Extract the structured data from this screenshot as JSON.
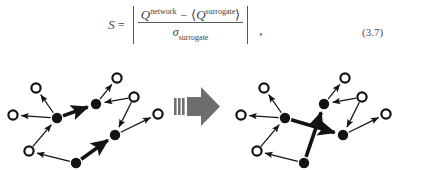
{
  "page": {
    "background": "#ffffff",
    "ink_color": "#2b2b2b"
  },
  "equation": {
    "label": "(3.7)",
    "lhs": "S",
    "relation": "=",
    "abs_bar": "|",
    "numerator": {
      "first_symbol": "Q",
      "first_superscript": "network",
      "operator": "−",
      "angle_open": "⟨",
      "second_symbol": "Q",
      "second_superscript": "surrogate",
      "angle_close": "⟩"
    },
    "denominator": {
      "symbol": "σ",
      "subscript": "surrogate"
    },
    "trailing_punctuation": ",",
    "plain_text": "S = |(Q^network − ⟨Q^surrogate⟩) / σ_surrogate|"
  },
  "figure": {
    "caption": "",
    "transition": {
      "icon": "block-arrow-right-icon",
      "color": "#6e6e6e",
      "stripes": 3
    },
    "networks": [
      {
        "id": "network-before",
        "title": "original network",
        "node_radius_filled": 5.2,
        "node_radius_open": 4.6,
        "nodes": [
          {
            "id": "n1",
            "x": 13,
            "y": 59,
            "type": "open"
          },
          {
            "id": "n2",
            "x": 36,
            "y": 32,
            "type": "open"
          },
          {
            "id": "n3",
            "x": 57,
            "y": 62,
            "type": "filled"
          },
          {
            "id": "n4",
            "x": 29,
            "y": 95,
            "type": "open"
          },
          {
            "id": "n5",
            "x": 76,
            "y": 107,
            "type": "filled"
          },
          {
            "id": "n6",
            "x": 96,
            "y": 48,
            "type": "filled"
          },
          {
            "id": "n7",
            "x": 117,
            "y": 22,
            "type": "open"
          },
          {
            "id": "n8",
            "x": 134,
            "y": 41,
            "type": "open"
          },
          {
            "id": "n9",
            "x": 115,
            "y": 79,
            "type": "filled"
          },
          {
            "id": "n10",
            "x": 158,
            "y": 58,
            "type": "open"
          }
        ],
        "edges": [
          {
            "from": "n3",
            "to": "n1",
            "weight": "thin"
          },
          {
            "from": "n3",
            "to": "n2",
            "weight": "thin"
          },
          {
            "from": "n3",
            "to": "n6",
            "weight": "thick"
          },
          {
            "from": "n4",
            "to": "n3",
            "weight": "thin"
          },
          {
            "from": "n5",
            "to": "n4",
            "weight": "thin"
          },
          {
            "from": "n5",
            "to": "n9",
            "weight": "thick"
          },
          {
            "from": "n6",
            "to": "n7",
            "weight": "thin"
          },
          {
            "from": "n8",
            "to": "n6",
            "weight": "thin"
          },
          {
            "from": "n8",
            "to": "n9",
            "weight": "thin"
          },
          {
            "from": "n9",
            "to": "n10",
            "weight": "thin"
          }
        ]
      },
      {
        "id": "network-after",
        "title": "surrogate (rewired) network",
        "node_radius_filled": 5.2,
        "node_radius_open": 4.6,
        "nodes": [
          {
            "id": "m1",
            "x": 13,
            "y": 59,
            "type": "open"
          },
          {
            "id": "m2",
            "x": 36,
            "y": 32,
            "type": "open"
          },
          {
            "id": "m3",
            "x": 57,
            "y": 62,
            "type": "filled"
          },
          {
            "id": "m4",
            "x": 29,
            "y": 95,
            "type": "open"
          },
          {
            "id": "m5",
            "x": 76,
            "y": 107,
            "type": "filled"
          },
          {
            "id": "m6",
            "x": 96,
            "y": 48,
            "type": "filled"
          },
          {
            "id": "m7",
            "x": 117,
            "y": 22,
            "type": "open"
          },
          {
            "id": "m8",
            "x": 134,
            "y": 41,
            "type": "open"
          },
          {
            "id": "m9",
            "x": 115,
            "y": 79,
            "type": "filled"
          },
          {
            "id": "m10",
            "x": 158,
            "y": 58,
            "type": "open"
          }
        ],
        "edges": [
          {
            "from": "m3",
            "to": "m1",
            "weight": "thin"
          },
          {
            "from": "m3",
            "to": "m2",
            "weight": "thin"
          },
          {
            "from": "m3",
            "to": "m9",
            "weight": "thick"
          },
          {
            "from": "m4",
            "to": "m3",
            "weight": "thin"
          },
          {
            "from": "m5",
            "to": "m4",
            "weight": "thin"
          },
          {
            "from": "m5",
            "to": "m6",
            "weight": "thick"
          },
          {
            "from": "m6",
            "to": "m7",
            "weight": "thin"
          },
          {
            "from": "m8",
            "to": "m6",
            "weight": "thin"
          },
          {
            "from": "m8",
            "to": "m9",
            "weight": "thin"
          },
          {
            "from": "m9",
            "to": "m10",
            "weight": "thin"
          }
        ]
      }
    ]
  }
}
